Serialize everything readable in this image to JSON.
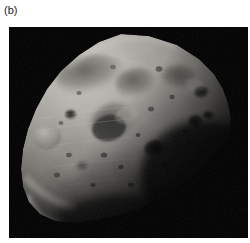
{
  "figure": {
    "panel_label": "(b)",
    "image_type": "grayscale-photograph",
    "background_color": "#000000",
    "page_background_color": "#ffffff",
    "label_color": "#1a1a1a",
    "image_region": {
      "left": 9,
      "top": 27,
      "width": 239,
      "height": 211
    },
    "body": {
      "terminator_note": "lower-right in shadow",
      "illumination_direction": "upper-left",
      "surface_tone_light": "#c9c6c0",
      "surface_tone_mid": "#8d8a85",
      "surface_tone_dark": "#3a3835",
      "limb_outline": "M 112,7 L 140,9 L 168,18 L 190,32 L 205,47 L 214,62 L 219,76 L 222,92 L 220,106 L 212,120 L 200,134 L 186,148 L 170,161 L 152,172 L 132,181 L 110,188 L 88,193 L 66,196 L 46,194 L 31,187 L 20,175 L 14,160 L 12,142 L 14,122 L 19,102 L 27,82 L 38,62 L 52,44 L 70,28 L 90,15 Z"
    },
    "craters": [
      {
        "name": "large-shallow-basin-upper-left",
        "cx": 82,
        "cy": 48,
        "rx": 36,
        "ry": 20,
        "tone": "dark"
      },
      {
        "name": "crater-upper-center",
        "cx": 128,
        "cy": 57,
        "rx": 22,
        "ry": 16,
        "tone": "dark"
      },
      {
        "name": "crater-upper-right",
        "cx": 172,
        "cy": 52,
        "rx": 20,
        "ry": 14,
        "tone": "dark"
      },
      {
        "name": "crater-right-shadowed",
        "cx": 193,
        "cy": 66,
        "rx": 8,
        "ry": 7,
        "tone": "very-dark"
      },
      {
        "name": "crater-right-pair-a",
        "cx": 187,
        "cy": 95,
        "rx": 8,
        "ry": 7,
        "tone": "very-dark"
      },
      {
        "name": "crater-right-pair-b",
        "cx": 199,
        "cy": 90,
        "rx": 6,
        "ry": 5,
        "tone": "very-dark"
      },
      {
        "name": "crater-center-main",
        "cx": 106,
        "cy": 96,
        "rx": 25,
        "ry": 20,
        "tone": "dark"
      },
      {
        "name": "crater-left-small",
        "cx": 62,
        "cy": 88,
        "rx": 6,
        "ry": 5,
        "tone": "very-dark"
      },
      {
        "name": "crater-left-bright-rim",
        "cx": 38,
        "cy": 110,
        "rx": 14,
        "ry": 12,
        "tone": "bright"
      },
      {
        "name": "crater-lower-center",
        "cx": 146,
        "cy": 122,
        "rx": 11,
        "ry": 9,
        "tone": "very-dark"
      },
      {
        "name": "crater-lower-right-bright",
        "cx": 160,
        "cy": 118,
        "rx": 9,
        "ry": 8,
        "tone": "bright"
      },
      {
        "name": "crater-lower-left-field",
        "cx": 74,
        "cy": 140,
        "rx": 7,
        "ry": 6,
        "tone": "dark"
      }
    ],
    "features": [
      {
        "name": "bright-ridge-lower-left",
        "description": "illuminated ridge along lower-left limb"
      },
      {
        "name": "bright-limb-tip-bottom",
        "description": "bright pointed tip at lower-left extremity"
      },
      {
        "name": "groove-striations",
        "description": "faint linear grooves across mid-body"
      }
    ]
  }
}
